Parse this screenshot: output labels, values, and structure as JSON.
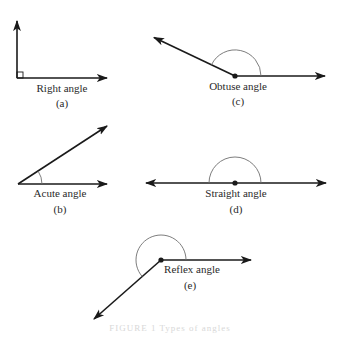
{
  "figure": {
    "caption": "FIGURE 1  Types of angles",
    "colors": {
      "ray": "#1a1a1a",
      "arc": "#6e6e6e",
      "text": "#2a2a2a",
      "background": "#ffffff"
    },
    "panels": [
      {
        "id": "a",
        "name": "Right angle",
        "sublabel": "(a)",
        "vertex": [
          17,
          78
        ],
        "rays": [
          [
            17,
            20
          ],
          [
            108,
            78
          ]
        ],
        "marker": "square"
      },
      {
        "id": "b",
        "name": "Acute angle",
        "sublabel": "(b)",
        "vertex": [
          18,
          184
        ],
        "rays": [
          [
            108,
            125
          ],
          [
            108,
            184
          ]
        ],
        "marker": "arc"
      },
      {
        "id": "c",
        "name": "Obtuse angle",
        "sublabel": "(c)",
        "vertex": [
          235,
          76
        ],
        "rays": [
          [
            153,
            37
          ],
          [
            326,
            76
          ]
        ],
        "marker": "arc"
      },
      {
        "id": "d",
        "name": "Straight angle",
        "sublabel": "(d)",
        "vertex": [
          235,
          183
        ],
        "rays": [
          [
            145,
            183
          ],
          [
            327,
            183
          ]
        ],
        "marker": "arc"
      },
      {
        "id": "e",
        "name": "Reflex angle",
        "sublabel": "(e)",
        "vertex": [
          161,
          260
        ],
        "rays": [
          [
            252,
            260
          ],
          [
            93,
            320
          ]
        ],
        "marker": "arc"
      }
    ]
  }
}
